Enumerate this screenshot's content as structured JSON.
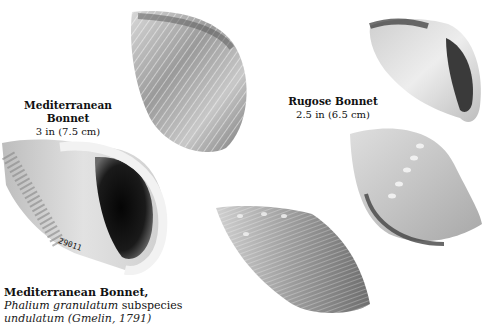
{
  "captions": {
    "mediterranean_top": {
      "title": "Mediterranean Bonnet",
      "size": "3 in (7.5 cm)"
    },
    "rugose": {
      "title": "Rugose Bonnet",
      "size": "2.5 in (6.5 cm)"
    },
    "mediterranean_bottom": {
      "title": "Mediterranean Bonnet,",
      "scientific_name": "Phalium granulatum",
      "scientific_suffix": " subspecies",
      "author_line": "undulatum (Gmelin, 1791)"
    }
  },
  "specimen_label": "29011",
  "shells": [
    {
      "name": "mediterranean-bonnet-dorsal",
      "view": "dorsal"
    },
    {
      "name": "mediterranean-bonnet-ventral",
      "view": "aperture"
    },
    {
      "name": "rugose-bonnet-ventral",
      "view": "aperture"
    },
    {
      "name": "rugose-bonnet-dorsal",
      "view": "dorsal"
    },
    {
      "name": "bonnet-side-view",
      "view": "side"
    }
  ]
}
